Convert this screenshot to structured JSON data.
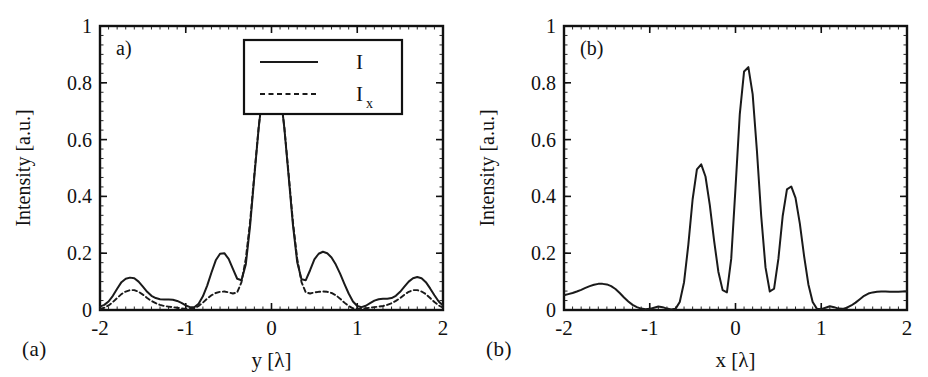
{
  "figure": {
    "background": "#ffffff",
    "line_color": "#1a1a1a",
    "axis_color": "#111111"
  },
  "panels": [
    {
      "id": "a",
      "inner_label": "a)",
      "caption": "(a)",
      "has_legend": true
    },
    {
      "id": "b",
      "inner_label": "(b)",
      "caption": "(b)",
      "has_legend": false
    }
  ],
  "legend": {
    "entries": [
      {
        "label": "I",
        "style": "solid"
      },
      {
        "label": "I",
        "sub": "x",
        "style": "dashed"
      }
    ]
  },
  "chart_data": [
    {
      "type": "line",
      "title": "a)",
      "xlabel": "y [λ]",
      "ylabel": "Intensity [a.u.]",
      "xlim": [
        -2,
        2
      ],
      "ylim": [
        0,
        1
      ],
      "xticks": [
        -2,
        -1,
        0,
        1,
        2
      ],
      "xticklabels": [
        "-2",
        "-1",
        "0",
        "1",
        "2"
      ],
      "yticks": [
        0,
        0.2,
        0.4,
        0.6,
        0.8,
        1
      ],
      "yticklabels": [
        "0",
        "0.2",
        "0.4",
        "0.6",
        "0.8",
        "1"
      ],
      "grid": false,
      "legend_position": "upper right",
      "series": [
        {
          "name": "I",
          "style": "solid",
          "x": [
            -2.0,
            -1.95,
            -1.9,
            -1.85,
            -1.8,
            -1.75,
            -1.7,
            -1.65,
            -1.6,
            -1.55,
            -1.5,
            -1.45,
            -1.4,
            -1.35,
            -1.3,
            -1.25,
            -1.2,
            -1.15,
            -1.1,
            -1.05,
            -1.0,
            -0.95,
            -0.9,
            -0.85,
            -0.8,
            -0.75,
            -0.7,
            -0.65,
            -0.6,
            -0.55,
            -0.5,
            -0.45,
            -0.4,
            -0.35,
            -0.3,
            -0.25,
            -0.2,
            -0.15,
            -0.1,
            -0.05,
            0.0,
            0.05,
            0.1,
            0.15,
            0.2,
            0.25,
            0.3,
            0.35,
            0.4,
            0.45,
            0.5,
            0.55,
            0.6,
            0.65,
            0.7,
            0.75,
            0.8,
            0.85,
            0.9,
            0.95,
            1.0,
            1.05,
            1.1,
            1.15,
            1.2,
            1.25,
            1.3,
            1.35,
            1.4,
            1.45,
            1.5,
            1.55,
            1.6,
            1.65,
            1.7,
            1.75,
            1.8,
            1.85,
            1.9,
            1.95,
            2.0
          ],
          "y": [
            0.012,
            0.018,
            0.03,
            0.05,
            0.075,
            0.098,
            0.11,
            0.114,
            0.112,
            0.1,
            0.082,
            0.064,
            0.05,
            0.042,
            0.038,
            0.037,
            0.037,
            0.036,
            0.032,
            0.025,
            0.016,
            0.01,
            0.01,
            0.022,
            0.048,
            0.086,
            0.132,
            0.175,
            0.198,
            0.2,
            0.18,
            0.145,
            0.11,
            0.105,
            0.16,
            0.295,
            0.47,
            0.64,
            0.775,
            0.845,
            0.855,
            0.845,
            0.775,
            0.64,
            0.47,
            0.3,
            0.168,
            0.108,
            0.105,
            0.14,
            0.178,
            0.198,
            0.205,
            0.2,
            0.185,
            0.16,
            0.128,
            0.092,
            0.058,
            0.03,
            0.014,
            0.01,
            0.015,
            0.024,
            0.033,
            0.038,
            0.04,
            0.04,
            0.042,
            0.05,
            0.064,
            0.082,
            0.1,
            0.112,
            0.116,
            0.112,
            0.098,
            0.076,
            0.052,
            0.03,
            0.016
          ]
        },
        {
          "name": "Ix",
          "style": "dashed",
          "x": [
            -2.0,
            -1.95,
            -1.9,
            -1.85,
            -1.8,
            -1.75,
            -1.7,
            -1.65,
            -1.6,
            -1.55,
            -1.5,
            -1.45,
            -1.4,
            -1.35,
            -1.3,
            -1.25,
            -1.2,
            -1.15,
            -1.1,
            -1.05,
            -1.0,
            -0.95,
            -0.9,
            -0.85,
            -0.8,
            -0.75,
            -0.7,
            -0.65,
            -0.6,
            -0.55,
            -0.5,
            -0.45,
            -0.4,
            -0.35,
            -0.3,
            -0.25,
            -0.2,
            -0.15,
            -0.1,
            -0.05,
            0.0,
            0.05,
            0.1,
            0.15,
            0.2,
            0.25,
            0.3,
            0.35,
            0.4,
            0.45,
            0.5,
            0.55,
            0.6,
            0.65,
            0.7,
            0.75,
            0.8,
            0.85,
            0.9,
            0.95,
            1.0,
            1.05,
            1.1,
            1.15,
            1.2,
            1.25,
            1.3,
            1.35,
            1.4,
            1.45,
            1.5,
            1.55,
            1.6,
            1.65,
            1.7,
            1.75,
            1.8,
            1.85,
            1.9,
            1.95,
            2.0
          ],
          "y": [
            0.004,
            0.008,
            0.016,
            0.028,
            0.042,
            0.056,
            0.065,
            0.07,
            0.07,
            0.064,
            0.054,
            0.042,
            0.032,
            0.024,
            0.018,
            0.014,
            0.012,
            0.01,
            0.008,
            0.006,
            0.004,
            0.004,
            0.006,
            0.014,
            0.026,
            0.04,
            0.052,
            0.06,
            0.064,
            0.065,
            0.062,
            0.058,
            0.062,
            0.098,
            0.18,
            0.31,
            0.478,
            0.642,
            0.776,
            0.845,
            0.855,
            0.845,
            0.776,
            0.642,
            0.478,
            0.31,
            0.18,
            0.098,
            0.062,
            0.058,
            0.062,
            0.064,
            0.065,
            0.064,
            0.06,
            0.052,
            0.04,
            0.026,
            0.014,
            0.006,
            0.004,
            0.004,
            0.006,
            0.008,
            0.01,
            0.012,
            0.014,
            0.018,
            0.024,
            0.032,
            0.042,
            0.054,
            0.064,
            0.07,
            0.07,
            0.065,
            0.056,
            0.042,
            0.028,
            0.016,
            0.008
          ]
        }
      ]
    },
    {
      "type": "line",
      "title": "(b)",
      "xlabel": "x [λ]",
      "ylabel": "Intensity [a.u.]",
      "xlim": [
        -2,
        2
      ],
      "ylim": [
        0,
        1
      ],
      "xticks": [
        -2,
        -1,
        0,
        1,
        2
      ],
      "xticklabels": [
        "-2",
        "-1",
        "0",
        "1",
        "2"
      ],
      "yticks": [
        0,
        0.2,
        0.4,
        0.6,
        0.8,
        1
      ],
      "yticklabels": [
        "0",
        "0.2",
        "0.4",
        "0.6",
        "0.8",
        "1"
      ],
      "grid": false,
      "legend_position": "none",
      "series": [
        {
          "name": "I",
          "style": "solid",
          "x": [
            -2.0,
            -1.95,
            -1.9,
            -1.85,
            -1.8,
            -1.75,
            -1.7,
            -1.65,
            -1.6,
            -1.55,
            -1.5,
            -1.45,
            -1.4,
            -1.35,
            -1.3,
            -1.25,
            -1.2,
            -1.15,
            -1.1,
            -1.05,
            -1.0,
            -0.95,
            -0.9,
            -0.85,
            -0.8,
            -0.75,
            -0.7,
            -0.65,
            -0.6,
            -0.55,
            -0.5,
            -0.45,
            -0.4,
            -0.35,
            -0.3,
            -0.25,
            -0.2,
            -0.15,
            -0.1,
            -0.05,
            0.0,
            0.05,
            0.1,
            0.15,
            0.2,
            0.25,
            0.3,
            0.35,
            0.4,
            0.45,
            0.5,
            0.55,
            0.6,
            0.65,
            0.7,
            0.75,
            0.8,
            0.85,
            0.9,
            0.95,
            1.0,
            1.05,
            1.1,
            1.15,
            1.2,
            1.25,
            1.3,
            1.35,
            1.4,
            1.45,
            1.5,
            1.55,
            1.6,
            1.65,
            1.7,
            1.75,
            1.8,
            1.85,
            1.9,
            1.95,
            2.0
          ],
          "y": [
            0.052,
            0.056,
            0.06,
            0.065,
            0.071,
            0.078,
            0.084,
            0.089,
            0.092,
            0.092,
            0.09,
            0.084,
            0.074,
            0.06,
            0.044,
            0.03,
            0.018,
            0.01,
            0.005,
            0.003,
            0.004,
            0.008,
            0.012,
            0.01,
            0.005,
            0.002,
            0.004,
            0.028,
            0.098,
            0.23,
            0.39,
            0.495,
            0.513,
            0.47,
            0.37,
            0.245,
            0.135,
            0.07,
            0.062,
            0.18,
            0.43,
            0.69,
            0.84,
            0.855,
            0.76,
            0.56,
            0.33,
            0.15,
            0.065,
            0.075,
            0.18,
            0.33,
            0.425,
            0.435,
            0.395,
            0.305,
            0.19,
            0.09,
            0.028,
            0.004,
            0.003,
            0.008,
            0.013,
            0.01,
            0.005,
            0.004,
            0.008,
            0.016,
            0.026,
            0.038,
            0.05,
            0.058,
            0.062,
            0.064,
            0.065,
            0.065,
            0.064,
            0.064,
            0.064,
            0.065,
            0.065
          ]
        }
      ]
    }
  ]
}
